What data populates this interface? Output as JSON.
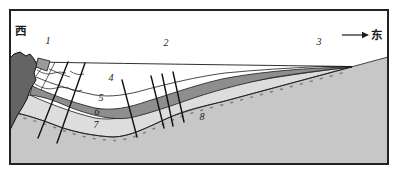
{
  "figure": {
    "type": "geological-cross-section",
    "direction_labels": {
      "west": "西",
      "east": "东"
    },
    "zone_labels": {
      "zone1": "1",
      "zone2": "2",
      "zone3": "3"
    },
    "unit_labels": {
      "unit4": "4",
      "unit5": "5",
      "unit6": "6",
      "unit7": "7",
      "unit8": "8"
    },
    "colors": {
      "frame_background": "#ffffff",
      "dark_intrusion": "#646464",
      "fault_block": "#9a9a9a",
      "layer6_band": "#8e8e8e",
      "layer7_band": "#dddddd",
      "basement": "#c7c7c7",
      "line": "#1a1a1a"
    }
  }
}
